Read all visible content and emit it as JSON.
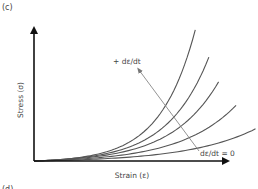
{
  "panel_label": "(c)",
  "next_panel_label": "(d)",
  "chart_data": {
    "type": "line",
    "title": "",
    "xlabel": "Strain (ε)",
    "ylabel": "Stress (σ)",
    "axis_ticks": "none",
    "grid": false,
    "series": [
      {
        "name": "curve-1 (highest strain rate)",
        "x_end": 0.83,
        "y_end": 1.06,
        "k": 4.6
      },
      {
        "name": "curve-2",
        "x_end": 0.9,
        "y_end": 0.84,
        "k": 4.2
      },
      {
        "name": "curve-3",
        "x_end": 0.95,
        "y_end": 0.64,
        "k": 3.9
      },
      {
        "name": "curve-4",
        "x_end": 1.04,
        "y_end": 0.45,
        "k": 3.6
      },
      {
        "name": "curve-5 (dε/dt = 0)",
        "x_end": 1.14,
        "y_end": 0.26,
        "k": 3.3
      }
    ],
    "annotations": [
      {
        "text": "+ dε/dt",
        "role": "arrow-head-label",
        "meaning": "increasing strain rate direction"
      },
      {
        "text": "dε/dt = 0",
        "role": "arrow-tail-label",
        "meaning": "zero strain rate curve"
      }
    ],
    "xlim": [
      0,
      1.15
    ],
    "ylim": [
      0,
      1.1
    ]
  },
  "colors": {
    "axis": "#111111",
    "curve": "#555555",
    "arrow": "#888888",
    "text": "#444444"
  }
}
